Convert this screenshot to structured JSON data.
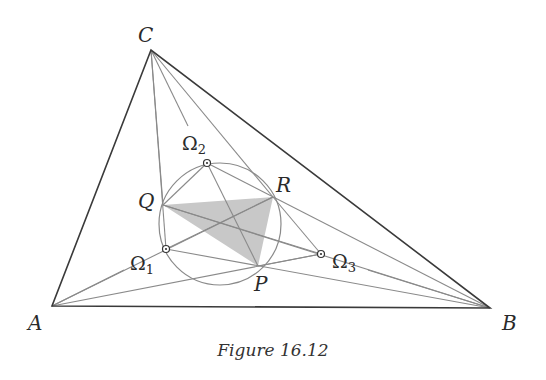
{
  "figure": {
    "caption": "Figure 16.12",
    "vertices": {
      "A": {
        "label": "A",
        "x": 52,
        "y": 306
      },
      "B": {
        "label": "B",
        "x": 490,
        "y": 308
      },
      "C": {
        "label": "C",
        "x": 151,
        "y": 50
      }
    },
    "points": {
      "P": {
        "label": "P",
        "x": 258,
        "y": 266
      },
      "Q": {
        "label": "Q",
        "x": 163,
        "y": 205
      },
      "R": {
        "label": "R",
        "x": 273,
        "y": 197
      }
    },
    "brocard_points": {
      "omega1": {
        "label": "Ω",
        "sub": "1",
        "x": 166,
        "y": 249
      },
      "omega2": {
        "label": "Ω",
        "sub": "2",
        "x": 207,
        "y": 163
      },
      "omega3": {
        "label": "Ω",
        "sub": "3",
        "x": 321,
        "y": 254
      }
    },
    "circle": {
      "cx": 220,
      "cy": 224,
      "r": 61
    },
    "colors": {
      "triangle_edges": "#3a3a3a",
      "cevians": "#8a8a8a",
      "shaded_triangle": "#c8c8c8"
    }
  }
}
